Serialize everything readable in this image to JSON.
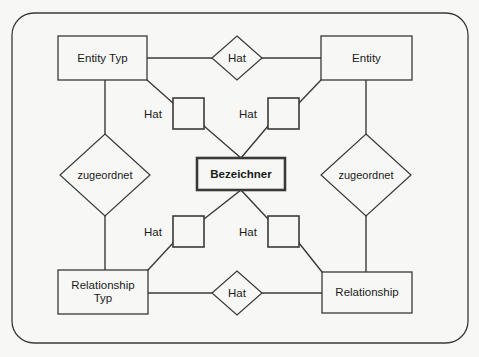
{
  "diagram": {
    "background_color": "#f7f7f6",
    "line_color": "#3a3a3a",
    "text_color": "#1a1a1a",
    "frame": {
      "name": "outer-rounded-frame",
      "x": 12,
      "y": 13,
      "width": 456,
      "height": 330,
      "radius": 22
    },
    "entities": [
      {
        "id": "entity-typ",
        "label": "Entity Typ",
        "line1": "Entity Typ",
        "line2": "",
        "x": 58,
        "y": 36,
        "width": 89,
        "height": 44,
        "bold": false
      },
      {
        "id": "entity",
        "label": "Entity",
        "line1": "Entity",
        "line2": "",
        "x": 321,
        "y": 36,
        "width": 91,
        "height": 44,
        "bold": false
      },
      {
        "id": "bezeichner",
        "label": "Bezeichner",
        "line1": "Bezeichner",
        "line2": "",
        "x": 197,
        "y": 158,
        "width": 88,
        "height": 32,
        "bold": true
      },
      {
        "id": "relationship-typ",
        "label": "Relationship Typ",
        "line1": "Relationship",
        "line2": "Typ",
        "x": 58,
        "y": 270,
        "width": 90,
        "height": 44,
        "bold": false
      },
      {
        "id": "relationship",
        "label": "Relationship",
        "line1": "Relationship",
        "line2": "",
        "x": 322,
        "y": 272,
        "width": 90,
        "height": 41,
        "bold": false
      }
    ],
    "relationship_diamonds": [
      {
        "id": "hat-top",
        "label": "Hat",
        "cx": 237,
        "cy": 58,
        "rx": 25,
        "ry": 22
      },
      {
        "id": "zugeordnet-left",
        "label": "zugeordnet",
        "cx": 105,
        "cy": 175,
        "rx": 45,
        "ry": 41
      },
      {
        "id": "zugeordnet-right",
        "label": "zugeordnet",
        "cx": 366,
        "cy": 175,
        "rx": 45,
        "ry": 41
      },
      {
        "id": "hat-bottom",
        "label": "Hat",
        "cx": 237,
        "cy": 293,
        "rx": 25,
        "ry": 22
      }
    ],
    "squares": [
      {
        "id": "hat-square-top-left",
        "label": "Hat",
        "x": 173,
        "y": 98,
        "width": 31,
        "height": 31,
        "label_x": 136,
        "label_y": 106
      },
      {
        "id": "hat-square-top-right",
        "label": "Hat",
        "x": 268,
        "y": 98,
        "width": 31,
        "height": 31,
        "label_x": 231,
        "label_y": 106
      },
      {
        "id": "hat-square-bottom-left",
        "label": "Hat",
        "x": 173,
        "y": 216,
        "width": 31,
        "height": 31,
        "label_x": 136,
        "label_y": 224
      },
      {
        "id": "hat-square-bottom-right",
        "label": "Hat",
        "x": 268,
        "y": 216,
        "width": 31,
        "height": 31,
        "label_x": 231,
        "label_y": 224
      }
    ],
    "connectors": [
      {
        "id": "entitytyp-to-hat-top",
        "points": "147,58 212,58"
      },
      {
        "id": "hat-top-to-entity",
        "points": "262,58 321,58"
      },
      {
        "id": "entitytyp-to-zugeordnet-l",
        "points": "105,80 105,134"
      },
      {
        "id": "zugeordnet-l-to-relationshiptyp",
        "points": "105,216 105,270"
      },
      {
        "id": "entity-to-zugeordnet-r",
        "points": "366,80 366,134"
      },
      {
        "id": "zugeordnet-r-to-relationship",
        "points": "366,216 366,272"
      },
      {
        "id": "entitytyp-to-sq-tl",
        "points": "147,80 173,103"
      },
      {
        "id": "sq-tl-to-bezeichner",
        "points": "204,126 241,158"
      },
      {
        "id": "entity-to-sq-tr",
        "points": "321,80 299,103"
      },
      {
        "id": "sq-tr-to-bezeichner",
        "points": "268,126 241,158"
      },
      {
        "id": "bezeichner-to-sq-bl",
        "points": "241,190 204,219"
      },
      {
        "id": "sq-bl-to-relationshiptyp",
        "points": "173,243 148,270"
      },
      {
        "id": "bezeichner-to-sq-br",
        "points": "241,190 268,219"
      },
      {
        "id": "sq-br-to-relationship",
        "points": "299,243 322,272"
      },
      {
        "id": "relationshiptyp-to-hat-bottom",
        "points": "148,293 212,293"
      },
      {
        "id": "hat-bottom-to-relationship",
        "points": "262,293 322,293"
      }
    ]
  }
}
